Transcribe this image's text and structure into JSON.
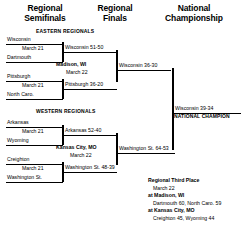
{
  "headers": {
    "semifinals": "Regional\nSemifinals",
    "semifinals_l1": "Regional",
    "semifinals_l2": "Semifinals",
    "finals_l1": "Regional",
    "finals_l2": "Finals",
    "championship_l1": "National",
    "championship_l2": "Championship"
  },
  "regions": {
    "east": "EASTERN REGIONALS",
    "west": "WESTERN REGIONALS"
  },
  "east": {
    "semifinal_1": {
      "team_top": "Wisconsin",
      "team_bottom": "Dartmouth",
      "date": "March 21"
    },
    "semifinal_2": {
      "team_top": "Pittsburgh",
      "team_bottom": "North Caro.",
      "date": "March 21"
    },
    "result_1": "Wisconsin 51-50",
    "result_2": "Pittsburgh 36-20",
    "final": {
      "site": "Madison, WI",
      "date": "March 22",
      "result": "Wisconsin 36-30"
    }
  },
  "west": {
    "semifinal_1": {
      "team_top": "Arkansas",
      "team_bottom": "Wyoming",
      "date": "March 21"
    },
    "semifinal_2": {
      "team_top": "Creighton",
      "team_bottom": "Washington St.",
      "date": "March 21"
    },
    "result_1": "Arkansas 52-40",
    "result_2": "Washington St. 48-39",
    "final": {
      "site": "Kansas City, MO",
      "date": "March 22",
      "result": "Washington St. 64-53"
    }
  },
  "championship": {
    "result": "Wisconsin 39-34",
    "label": "NATIONAL CHAMPION"
  },
  "third_place": {
    "title": "Regional Third Place",
    "date": "March 22",
    "site_1": "at Madison, WI",
    "game_1": "Dartmouth 60, North Caro. 59",
    "site_2": "at Kansas City, MO",
    "game_2": "Creighton 45, Wyoming 44"
  }
}
